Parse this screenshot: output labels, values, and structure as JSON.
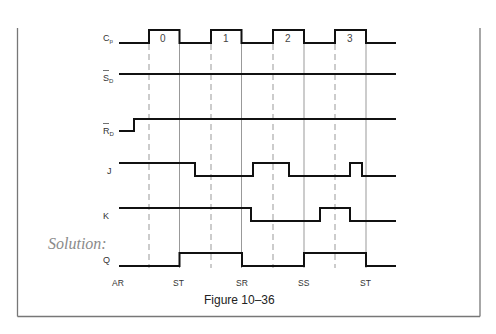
{
  "figure": {
    "caption": "Figure 10–36",
    "solution_label": "Solution:"
  },
  "signals": [
    {
      "id": "cp",
      "label": "C",
      "subscript": "p",
      "overbar": false
    },
    {
      "id": "sd",
      "label": "S",
      "subscript": "D",
      "overbar": true
    },
    {
      "id": "rd",
      "label": "R",
      "subscript": "D",
      "overbar": true
    },
    {
      "id": "j",
      "label": "J",
      "subscript": "",
      "overbar": false
    },
    {
      "id": "k",
      "label": "K",
      "subscript": "",
      "overbar": false
    },
    {
      "id": "q",
      "label": "Q",
      "subscript": "",
      "overbar": false
    }
  ],
  "clock_pulses": [
    "0",
    "1",
    "2",
    "3"
  ],
  "states": [
    "AR",
    "ST",
    "SR",
    "SS",
    "ST"
  ],
  "colors": {
    "signal": "#111111",
    "guide": "#999999",
    "frame": "#777777",
    "solution_text": "#8a8a8a"
  }
}
